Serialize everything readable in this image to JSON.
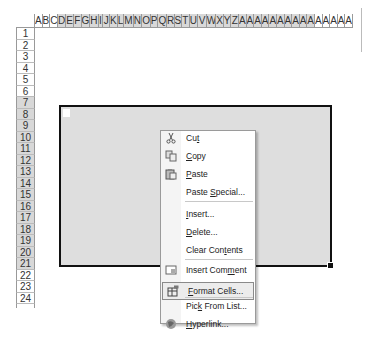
{
  "spreadsheet": {
    "columns": [
      "A",
      "B",
      "C",
      "D",
      "E",
      "F",
      "G",
      "H",
      "I",
      "J",
      "K",
      "L",
      "M",
      "N",
      "O",
      "P",
      "Q",
      "R",
      "S",
      "T",
      "U",
      "V",
      "W",
      "X",
      "Y",
      "Z",
      "A",
      "A",
      "A",
      "A",
      "A",
      "A",
      "A",
      "A",
      "A",
      "A",
      "A",
      "A",
      "A",
      "A",
      "A"
    ],
    "selected_columns_range": "D:AJ",
    "rows": [
      "1",
      "2",
      "3",
      "4",
      "5",
      "6",
      "7",
      "8",
      "9",
      "10",
      "11",
      "12",
      "13",
      "14",
      "15",
      "16",
      "17",
      "18",
      "19",
      "20",
      "21",
      "22",
      "23",
      "24"
    ],
    "selected_rows_range": "7:21",
    "selection_fill_color": "#dedede",
    "selection_border_color": "#111111",
    "header_selected_color": "#d8d8d8"
  },
  "context_menu": {
    "items": [
      {
        "label": "Cut",
        "mnemonic_index": 2,
        "icon": "scissors-icon"
      },
      {
        "label": "Copy",
        "mnemonic_index": 0,
        "icon": "copy-icon"
      },
      {
        "label": "Paste",
        "mnemonic_index": 0,
        "icon": "paste-icon"
      },
      {
        "label": "Paste Special...",
        "mnemonic_index": 6,
        "icon": ""
      },
      {
        "label": "Insert...",
        "mnemonic_index": 0,
        "icon": ""
      },
      {
        "label": "Delete...",
        "mnemonic_index": 0,
        "icon": ""
      },
      {
        "label": "Clear Contents",
        "mnemonic_index": 9,
        "icon": ""
      },
      {
        "label": "Insert Comment",
        "mnemonic_index": 10,
        "icon": "comment-icon"
      },
      {
        "label": "Format Cells...",
        "mnemonic_index": 0,
        "icon": "format-cells-icon",
        "highlighted": true
      },
      {
        "label": "Pick From List...",
        "mnemonic_index": 3,
        "icon": ""
      },
      {
        "label": "Hyperlink...",
        "mnemonic_index": 0,
        "icon": "hyperlink-icon"
      }
    ]
  }
}
